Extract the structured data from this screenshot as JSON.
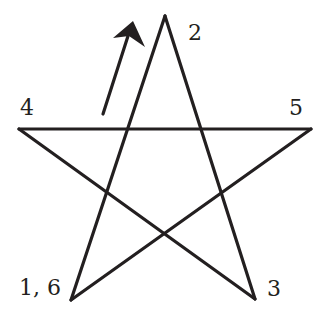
{
  "diagram": {
    "colors": {
      "ink": "#231f20",
      "background": "#ffffff"
    },
    "vertices": [
      {
        "id": "v1",
        "label": "1, 6",
        "position": "bottom-left"
      },
      {
        "id": "v2",
        "label": "2",
        "position": "top"
      },
      {
        "id": "v3",
        "label": "3",
        "position": "bottom-right"
      },
      {
        "id": "v4",
        "label": "4",
        "position": "left"
      },
      {
        "id": "v5",
        "label": "5",
        "position": "right"
      }
    ],
    "stroke_order": [
      "1",
      "2",
      "3",
      "4",
      "5",
      "6"
    ],
    "edges": [
      {
        "from": "1",
        "to": "2"
      },
      {
        "from": "2",
        "to": "3"
      },
      {
        "from": "3",
        "to": "4"
      },
      {
        "from": "4",
        "to": "5"
      },
      {
        "from": "5",
        "to": "6"
      }
    ],
    "direction_arrow": {
      "meaning": "start direction from 1 toward 2",
      "icon": "arrow-up-right-icon"
    }
  }
}
